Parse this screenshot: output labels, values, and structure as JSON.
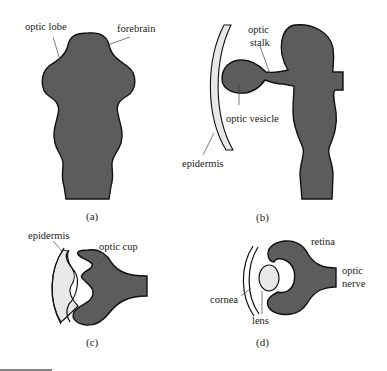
{
  "figure": {
    "colors": {
      "tissue": "#5c5c5c",
      "outline": "#111111",
      "pale_tissue": "#e8e8e8",
      "background": "#ffffff"
    },
    "panels": [
      {
        "id": "a",
        "caption": "(a)",
        "labels": {
          "optic_lobe": "optic lobe",
          "forebrain": "forebrain"
        }
      },
      {
        "id": "b",
        "caption": "(b)",
        "labels": {
          "optic_stalk_line1": "optic",
          "optic_stalk_line2": "stalk",
          "optic_vesicle": "optic vesicle",
          "epidermis": "epidermis"
        }
      },
      {
        "id": "c",
        "caption": "(c)",
        "labels": {
          "epidermis": "epidermis",
          "optic_cup": "optic cup"
        }
      },
      {
        "id": "d",
        "caption": "(d)",
        "labels": {
          "retina": "retina",
          "optic_nerve_line1": "optic",
          "optic_nerve_line2": "nerve",
          "cornea": "cornea",
          "lens": "lens"
        }
      }
    ]
  }
}
